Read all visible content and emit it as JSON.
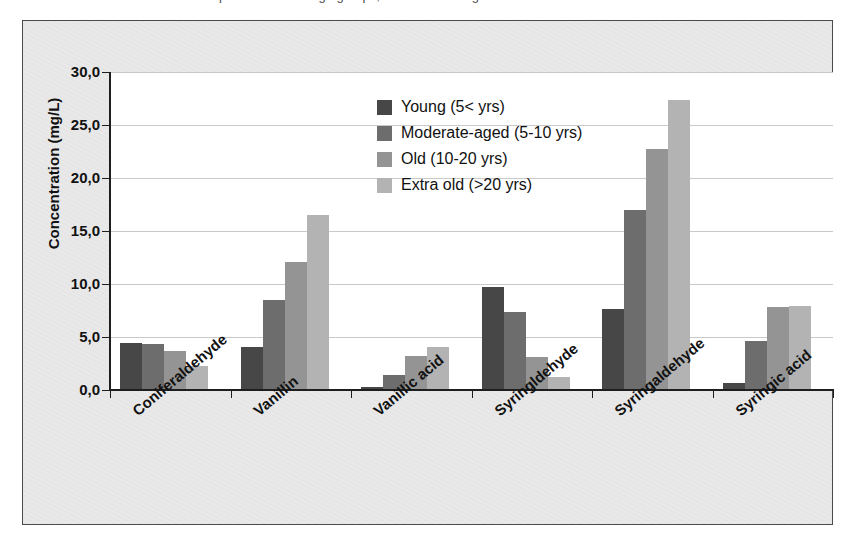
{
  "top_caption": {
    "text": "determined in the wine samples of different age groups, are shown in Figure 4."
  },
  "chart_data": {
    "type": "bar",
    "title": "",
    "subtitle": "",
    "xlabel": "",
    "ylabel": "Concentration (mg/L)",
    "ylim": [
      0,
      30
    ],
    "ytick_labels": [
      "30,0",
      "25,0",
      "20,0",
      "15,0",
      "10,0",
      "5,0",
      "0,0"
    ],
    "ytick_values": [
      30,
      25,
      20,
      15,
      10,
      5,
      0
    ],
    "grid": true,
    "legend_position": "inside-top-center",
    "categories": [
      "Coniferaldehyde",
      "Vanillin",
      "Vanillic acid",
      "Syringldehyde",
      "Syringaldehyde",
      "Syringic acid"
    ],
    "series": [
      {
        "name": "Young (5< yrs)",
        "color": "#474747",
        "values": [
          4.4,
          4.1,
          0.3,
          9.7,
          7.6,
          0.7
        ]
      },
      {
        "name": "Moderate-aged (5-10 yrs)",
        "color": "#6d6d6d",
        "values": [
          4.3,
          8.5,
          1.4,
          7.4,
          17.0,
          4.6
        ]
      },
      {
        "name": "Old (10-20 yrs)",
        "color": "#949494",
        "values": [
          3.7,
          12.1,
          3.2,
          3.1,
          22.7,
          7.8
        ]
      },
      {
        "name": "Extra old (>20 yrs)",
        "color": "#b3b3b3",
        "values": [
          2.3,
          16.5,
          4.1,
          1.2,
          27.4,
          7.9
        ]
      }
    ]
  },
  "colors": {
    "series_0": "#474747",
    "series_1": "#6d6d6d",
    "series_2": "#949494",
    "series_3": "#b3b3b3",
    "paper": "#ececed",
    "plot_background": "#ffffff",
    "gridline": "#c9c9c9",
    "axis": "#1e1e1e"
  }
}
